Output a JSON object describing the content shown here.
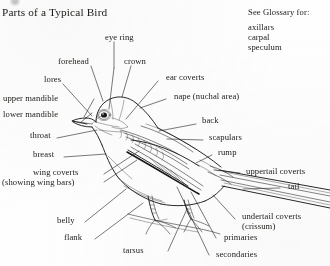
{
  "page": {
    "title": "Parts of a Typical Bird",
    "background_color": "#fefefe",
    "ink_color": "#1a1a18"
  },
  "glossary": {
    "heading": "See Glossary for:",
    "items": [
      "axillars",
      "carpal",
      "speculum"
    ]
  },
  "labels": {
    "eye_ring": "eye ring",
    "forehead": "forehead",
    "crown": "crown",
    "lores": "lores",
    "ear_coverts": "ear coverts",
    "upper_mandible": "upper mandible",
    "lower_mandible": "lower mandible",
    "nape": "nape (nuchal area)",
    "throat": "throat",
    "back": "back",
    "scapulars": "scapulars",
    "breast": "breast",
    "rump": "rump",
    "wing_coverts": "wing coverts",
    "wing_coverts_sub": "(showing wing bars)",
    "uppertail_coverts": "uppertail coverts",
    "tail": "tail",
    "belly": "belly",
    "undertail_coverts": "undertail coverts",
    "undertail_coverts_sub": "(crissum)",
    "flank": "flank",
    "primaries": "primaries",
    "tarsus": "tarsus",
    "secondaries": "secondaries"
  }
}
